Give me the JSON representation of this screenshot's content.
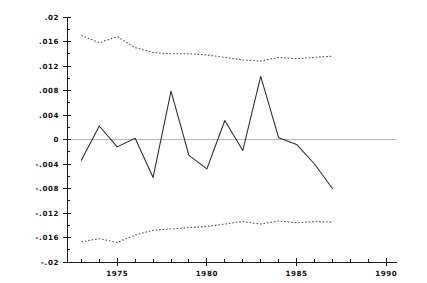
{
  "chart_data": {
    "type": "line",
    "title": "",
    "subtitle": "",
    "xlabel": "",
    "ylabel": "",
    "xlim": [
      1972.2,
      1990.6
    ],
    "ylim": [
      -0.02,
      0.02
    ],
    "grid": false,
    "legend": null,
    "zero_reference_line": 0,
    "y_ticks": [
      {
        "value": 0.02,
        "label": ".02"
      },
      {
        "value": 0.016,
        "label": ".016"
      },
      {
        "value": 0.012,
        "label": ".012"
      },
      {
        "value": 0.008,
        "label": ".008"
      },
      {
        "value": 0.004,
        "label": ".004"
      },
      {
        "value": 0,
        "label": "0"
      },
      {
        "value": -0.004,
        "label": "-.004"
      },
      {
        "value": -0.008,
        "label": "-.008"
      },
      {
        "value": -0.012,
        "label": "-.012"
      },
      {
        "value": -0.016,
        "label": "-.016"
      },
      {
        "value": -0.02,
        "label": "-.02"
      }
    ],
    "y_minor_ticks": [
      0.018,
      0.014,
      0.01,
      0.006,
      0.002,
      -0.002,
      -0.006,
      -0.01,
      -0.014,
      -0.018
    ],
    "x_ticks": [
      {
        "value": 1975,
        "label": "1975"
      },
      {
        "value": 1980,
        "label": "1980"
      },
      {
        "value": 1985,
        "label": "1985"
      },
      {
        "value": 1990,
        "label": "1990"
      }
    ],
    "x_minor_ticks": [
      1973,
      1974,
      1976,
      1977,
      1978,
      1979,
      1981,
      1982,
      1983,
      1984,
      1986,
      1987,
      1988,
      1989
    ],
    "x": [
      1973,
      1974,
      1975,
      1976,
      1977,
      1978,
      1979,
      1980,
      1981,
      1982,
      1983,
      1984,
      1985,
      1986,
      1987
    ],
    "series": [
      {
        "name": "residual",
        "style": "solid",
        "color": "#2a2a2a",
        "values": [
          -0.0034,
          0.0022,
          -0.0012,
          0.0002,
          -0.0062,
          0.0079,
          -0.0026,
          -0.0048,
          0.0031,
          -0.0018,
          0.0103,
          0.0003,
          -0.0008,
          -0.004,
          -0.008
        ]
      },
      {
        "name": "upper-band",
        "style": "dotted",
        "color": "#4a4a4a",
        "values": [
          0.017,
          0.0158,
          0.0168,
          0.015,
          0.0142,
          0.014,
          0.014,
          0.0138,
          0.0134,
          0.013,
          0.0128,
          0.0134,
          0.0132,
          0.0134,
          0.0136
        ]
      },
      {
        "name": "lower-band",
        "style": "dotted",
        "color": "#4a4a4a",
        "values": [
          -0.0167,
          -0.0162,
          -0.0168,
          -0.0156,
          -0.0148,
          -0.0146,
          -0.0144,
          -0.0142,
          -0.0138,
          -0.0134,
          -0.0138,
          -0.0133,
          -0.0136,
          -0.0134,
          -0.0135
        ]
      }
    ]
  },
  "plot": {
    "left_px": 67,
    "right_px": 397,
    "top_px": 17,
    "bottom_px": 262
  }
}
